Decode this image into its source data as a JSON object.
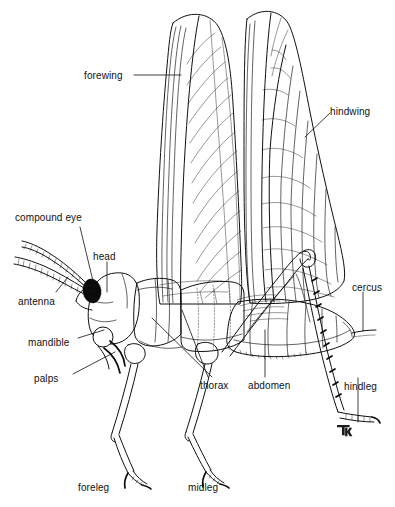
{
  "figure": {
    "background_color": "#ffffff",
    "ink_color": "#101010",
    "width": 395,
    "height": 507,
    "signature": "TM"
  },
  "labels": {
    "forewing": "forewing",
    "hindwing": "hindwing",
    "compound_eye": "compound eye",
    "head": "head",
    "antenna": "antenna",
    "mandible": "mandible",
    "palps": "palps",
    "thorax": "thorax",
    "abdomen": "abdomen",
    "cercus": "cercus",
    "hindleg": "hindleg",
    "foreleg": "foreleg",
    "midleg": "midleg"
  },
  "label_positions": {
    "forewing": {
      "x": 84,
      "y": 78
    },
    "hindwing": {
      "x": 330,
      "y": 108
    },
    "compound_eye": {
      "x": 15,
      "y": 213
    },
    "head": {
      "x": 93,
      "y": 255
    },
    "antenna": {
      "x": 18,
      "y": 298
    },
    "mandible": {
      "x": 28,
      "y": 341
    },
    "palps": {
      "x": 34,
      "y": 376
    },
    "thorax": {
      "x": 200,
      "y": 384
    },
    "abdomen": {
      "x": 248,
      "y": 384
    },
    "cercus": {
      "x": 352,
      "y": 285
    },
    "hindleg": {
      "x": 345,
      "y": 385
    },
    "foreleg": {
      "x": 78,
      "y": 485
    },
    "midleg": {
      "x": 188,
      "y": 485
    }
  },
  "parts": [
    {
      "name": "forewing",
      "description": "long narrow tegmen, upright, dense parallel venation"
    },
    {
      "name": "hindwing",
      "description": "broad fan-shaped membranous wing behind forewing"
    },
    {
      "name": "compound eye",
      "description": "solid black oval on side of head"
    },
    {
      "name": "head",
      "description": "capsule bearing eye, antenna and mouthparts"
    },
    {
      "name": "antenna",
      "description": "long segmented filament projecting forward"
    },
    {
      "name": "mandible",
      "description": "curved chewing jaw below the eye"
    },
    {
      "name": "palps",
      "description": "paired sensory appendages near the mouth"
    },
    {
      "name": "thorax",
      "description": "three-segmented middle body region bearing legs and wings"
    },
    {
      "name": "abdomen",
      "description": "segmented posterior body region"
    },
    {
      "name": "cercus",
      "description": "slender appendage at abdomen tip"
    },
    {
      "name": "hindleg",
      "description": "enlarged jumping leg with spined tibia"
    },
    {
      "name": "foreleg",
      "description": "front walking leg"
    },
    {
      "name": "midleg",
      "description": "middle walking leg"
    }
  ]
}
